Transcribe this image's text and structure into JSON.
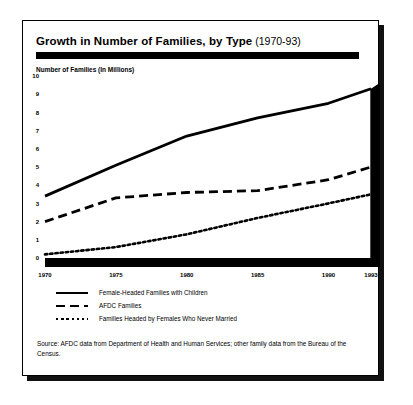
{
  "card": {
    "title_main": "Growth in Number of Families, by Type",
    "title_sub": "(1970-93)",
    "source": "Source: AFDC data from Department of Health and Human Services; other family data from the Bureau of the Census."
  },
  "chart_data": {
    "type": "line",
    "xlabel": "",
    "ylabel": "Number of Families (In Millions)",
    "x": [
      1970,
      1975,
      1980,
      1985,
      1990,
      1993
    ],
    "xtick_labels": [
      "1970",
      "1975",
      "1980",
      "1985",
      "1990",
      "1993"
    ],
    "ytick_labels": [
      "0",
      "1",
      "2",
      "3",
      "4",
      "5",
      "6",
      "7",
      "8",
      "9",
      "10"
    ],
    "xlim": [
      1970,
      1993
    ],
    "ylim": [
      0,
      10
    ],
    "grid": false,
    "legend_position": "below-plot",
    "series": [
      {
        "name": "Female-Headed Families with Children",
        "style": "solid",
        "values": [
          3.4,
          5.1,
          6.7,
          7.7,
          8.5,
          9.3
        ]
      },
      {
        "name": "AFDC Families",
        "style": "dashed",
        "values": [
          2.0,
          3.3,
          3.6,
          3.7,
          4.3,
          5.0
        ]
      },
      {
        "name": "Families Headed by Females Who Never Married",
        "style": "dotted",
        "values": [
          0.2,
          0.6,
          1.3,
          2.2,
          3.0,
          3.5
        ]
      }
    ]
  }
}
